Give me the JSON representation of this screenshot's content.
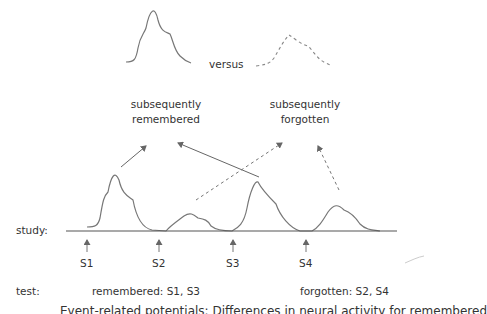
{
  "top": {
    "versus": "versus",
    "remembered_label_1": "subsequently",
    "remembered_label_2": "remembered",
    "forgotten_label_1": "subsequently",
    "forgotten_label_2": "forgotten"
  },
  "timeline": {
    "row_label": "study:",
    "stimuli": [
      "S1",
      "S2",
      "S3",
      "S4"
    ]
  },
  "test": {
    "row_label": "test:",
    "remembered": "remembered: S1, S3",
    "forgotten": "forgotten: S2, S4"
  },
  "caption_clipped": "Event-related potentials: Differences in neural activity for remembered"
}
